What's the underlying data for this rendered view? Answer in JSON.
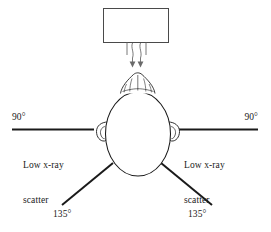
{
  "figure": {
    "background_color": "#ffffff",
    "stroke_color": "#1a1a1a",
    "beam_stroke_color": "#555555"
  },
  "source": {
    "name": "x-ray-tube-collimator",
    "shape": "rectangle",
    "label": ""
  },
  "beam": {
    "name": "primary-beam",
    "arrow_count": 2,
    "direction": "downward"
  },
  "patient": {
    "name": "head-superior-view",
    "features": [
      "skull-outline",
      "hair-tuft",
      "left-ear",
      "right-ear"
    ]
  },
  "annotations": {
    "left": {
      "angle": "90°",
      "scatter_label_lines": [
        "Low x-ray",
        "scatter",
        "area"
      ],
      "scatter_label": "Low x-ray scatter area",
      "lower_angle": "135°"
    },
    "right": {
      "angle": "90°",
      "scatter_label_lines": [
        "Low x-ray",
        "scatter",
        "area"
      ],
      "scatter_label": "Low x-ray scatter area",
      "lower_angle": "135°"
    }
  },
  "text": {
    "angle_left_90": "90°",
    "angle_right_90": "90°",
    "angle_left_135": "135°",
    "angle_right_135": "135°",
    "scatter_left_line1": "Low x-ray",
    "scatter_left_line2": "scatter",
    "scatter_left_line3": "area",
    "scatter_right_line1": "Low x-ray",
    "scatter_right_line2": "scatter",
    "scatter_right_line3": "area"
  }
}
